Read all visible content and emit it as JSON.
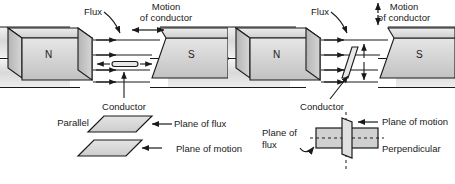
{
  "figure": {
    "colors": {
      "ink": "#1a1a1a",
      "magnet_light": "#e3e3e3",
      "magnet_mid": "#c9c9c9",
      "magnet_dark": "#a8a8a8",
      "plane_fill": "#d8d8d8",
      "paper": "#ffffff"
    }
  },
  "panels": {
    "left": {
      "name": "parallel-configuration",
      "flux_label": "Flux",
      "motion_label_line1": "Motion",
      "motion_label_line2": "of conductor",
      "motion_arrow": "horizontal-double",
      "north_pole": "N",
      "south_pole": "S",
      "conductor_label": "Conductor",
      "conductor_orientation": "horizontal",
      "flux_line_count": 4
    },
    "right": {
      "name": "perpendicular-configuration",
      "flux_label": "Flux",
      "motion_label_line1": "Motion",
      "motion_label_line2": "of conductor",
      "motion_arrow": "vertical-double",
      "north_pole": "N",
      "south_pole": "S",
      "conductor_label": "Conductor",
      "conductor_orientation": "diagonal",
      "flux_line_count": 4
    },
    "bottom_left": {
      "name": "parallel-planes-inset",
      "relation_label": "Parallel",
      "plane_of_flux_label": "Plane of flux",
      "plane_of_motion_label": "Plane of motion"
    },
    "bottom_right": {
      "name": "perpendicular-planes-inset",
      "relation_label": "Perpendicular",
      "plane_of_flux_label_line1": "Plane of",
      "plane_of_flux_label_line2": "flux",
      "plane_of_motion_label": "Plane of motion"
    }
  }
}
